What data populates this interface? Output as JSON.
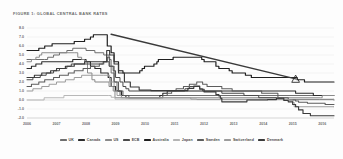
{
  "figure": {
    "title": "FIGURE 1: GLOBAL CENTRAL BANK RATES"
  },
  "chart_data": {
    "type": "line",
    "title": "FIGURE 1: GLOBAL CENTRAL BANK RATES",
    "xlabel": "",
    "ylabel": "",
    "xlim": [
      2006,
      2016.4
    ],
    "ylim": [
      -2.0,
      8.0
    ],
    "grid": true,
    "legend_position": "bottom",
    "x_ticks": [
      "2006",
      "2007",
      "2008",
      "2009",
      "2010",
      "2011",
      "2012",
      "2013",
      "2014",
      "2015",
      "2016"
    ],
    "y_ticks": [
      "8.0",
      "7.0",
      "6.0",
      "5.0",
      "4.0",
      "3.0",
      "2.0",
      "1.0",
      "0.0",
      "-1.0",
      "-2.0"
    ],
    "annotations": [
      {
        "name": "projection-marker",
        "shape": "triangle",
        "x": 2015.1,
        "y": 2.3
      }
    ],
    "series": [
      {
        "name": "UK",
        "color": "#6e6e6e",
        "width": 1.0,
        "points": [
          [
            2006.0,
            4.5
          ],
          [
            2006.6,
            4.5
          ],
          [
            2006.7,
            4.75
          ],
          [
            2006.9,
            5.0
          ],
          [
            2007.1,
            5.25
          ],
          [
            2007.35,
            5.5
          ],
          [
            2007.55,
            5.75
          ],
          [
            2007.9,
            5.75
          ],
          [
            2008.0,
            5.5
          ],
          [
            2008.3,
            5.25
          ],
          [
            2008.6,
            5.0
          ],
          [
            2008.78,
            4.5
          ],
          [
            2008.85,
            3.0
          ],
          [
            2008.95,
            2.0
          ],
          [
            2009.05,
            1.0
          ],
          [
            2009.15,
            0.5
          ],
          [
            2009.3,
            0.5
          ],
          [
            2016.4,
            0.5
          ]
        ]
      },
      {
        "name": "Canada",
        "color": "#2b2b2b",
        "width": 1.1,
        "points": [
          [
            2006.0,
            3.5
          ],
          [
            2006.15,
            3.75
          ],
          [
            2006.3,
            4.0
          ],
          [
            2006.5,
            4.25
          ],
          [
            2007.0,
            4.25
          ],
          [
            2007.55,
            4.5
          ],
          [
            2007.9,
            4.5
          ],
          [
            2008.0,
            4.25
          ],
          [
            2008.15,
            3.75
          ],
          [
            2008.3,
            3.5
          ],
          [
            2008.5,
            3.0
          ],
          [
            2008.75,
            2.5
          ],
          [
            2008.85,
            1.5
          ],
          [
            2009.0,
            1.0
          ],
          [
            2009.2,
            0.5
          ],
          [
            2009.35,
            0.25
          ],
          [
            2010.4,
            0.25
          ],
          [
            2010.5,
            0.5
          ],
          [
            2010.6,
            0.75
          ],
          [
            2010.75,
            1.0
          ],
          [
            2015.0,
            1.0
          ],
          [
            2015.1,
            0.75
          ],
          [
            2015.6,
            0.75
          ],
          [
            2015.7,
            0.5
          ],
          [
            2016.4,
            0.5
          ]
        ]
      },
      {
        "name": "US",
        "color": "#8a8a8a",
        "width": 1.0,
        "points": [
          [
            2006.0,
            4.25
          ],
          [
            2006.15,
            4.5
          ],
          [
            2006.3,
            4.75
          ],
          [
            2006.42,
            5.0
          ],
          [
            2006.5,
            5.25
          ],
          [
            2007.6,
            5.25
          ],
          [
            2007.72,
            4.75
          ],
          [
            2007.85,
            4.5
          ],
          [
            2007.95,
            4.25
          ],
          [
            2008.05,
            3.0
          ],
          [
            2008.2,
            2.25
          ],
          [
            2008.3,
            2.0
          ],
          [
            2008.78,
            1.5
          ],
          [
            2008.92,
            1.0
          ],
          [
            2008.98,
            0.25
          ],
          [
            2015.95,
            0.25
          ],
          [
            2016.0,
            0.5
          ],
          [
            2016.4,
            0.5
          ]
        ]
      },
      {
        "name": "ECB",
        "color": "#4a4a4a",
        "width": 1.0,
        "points": [
          [
            2006.0,
            2.25
          ],
          [
            2006.2,
            2.5
          ],
          [
            2006.45,
            2.75
          ],
          [
            2006.65,
            3.0
          ],
          [
            2006.9,
            3.25
          ],
          [
            2007.1,
            3.5
          ],
          [
            2007.35,
            3.75
          ],
          [
            2007.5,
            4.0
          ],
          [
            2008.5,
            4.0
          ],
          [
            2008.58,
            4.25
          ],
          [
            2008.78,
            3.75
          ],
          [
            2008.92,
            3.25
          ],
          [
            2009.0,
            2.5
          ],
          [
            2009.15,
            2.0
          ],
          [
            2009.25,
            1.5
          ],
          [
            2009.35,
            1.25
          ],
          [
            2009.45,
            1.0
          ],
          [
            2011.25,
            1.0
          ],
          [
            2011.35,
            1.25
          ],
          [
            2011.5,
            1.5
          ],
          [
            2011.85,
            1.25
          ],
          [
            2011.95,
            1.0
          ],
          [
            2012.6,
            0.75
          ],
          [
            2013.35,
            0.5
          ],
          [
            2013.85,
            0.25
          ],
          [
            2014.45,
            0.15
          ],
          [
            2014.65,
            0.05
          ],
          [
            2015.9,
            0.05
          ],
          [
            2016.4,
            0.0
          ]
        ]
      },
      {
        "name": "Australia",
        "color": "#1f1f1f",
        "width": 1.2,
        "points": [
          [
            2006.0,
            5.5
          ],
          [
            2006.4,
            5.75
          ],
          [
            2006.6,
            6.0
          ],
          [
            2006.85,
            6.25
          ],
          [
            2007.6,
            6.5
          ],
          [
            2007.95,
            6.75
          ],
          [
            2008.15,
            7.0
          ],
          [
            2008.25,
            7.25
          ],
          [
            2008.65,
            7.25
          ],
          [
            2008.72,
            6.0
          ],
          [
            2008.85,
            5.25
          ],
          [
            2008.95,
            4.25
          ],
          [
            2009.1,
            3.25
          ],
          [
            2009.25,
            3.0
          ],
          [
            2009.75,
            3.0
          ],
          [
            2009.82,
            3.25
          ],
          [
            2009.9,
            3.5
          ],
          [
            2009.98,
            3.75
          ],
          [
            2010.3,
            4.0
          ],
          [
            2010.4,
            4.25
          ],
          [
            2010.45,
            4.5
          ],
          [
            2010.95,
            4.75
          ],
          [
            2011.85,
            4.75
          ],
          [
            2011.92,
            4.5
          ],
          [
            2012.0,
            4.25
          ],
          [
            2012.4,
            3.75
          ],
          [
            2012.5,
            3.5
          ],
          [
            2012.85,
            3.25
          ],
          [
            2012.95,
            3.0
          ],
          [
            2013.4,
            2.75
          ],
          [
            2013.6,
            2.5
          ],
          [
            2015.15,
            2.25
          ],
          [
            2015.4,
            2.0
          ],
          [
            2016.4,
            2.0
          ]
        ]
      },
      {
        "name": "Japan",
        "color": "#b4b4b4",
        "width": 0.95,
        "points": [
          [
            2006.0,
            0.0
          ],
          [
            2006.5,
            0.0
          ],
          [
            2006.58,
            0.25
          ],
          [
            2007.15,
            0.25
          ],
          [
            2007.25,
            0.5
          ],
          [
            2008.75,
            0.5
          ],
          [
            2008.85,
            0.3
          ],
          [
            2008.98,
            0.1
          ],
          [
            2016.4,
            0.1
          ]
        ]
      },
      {
        "name": "Sweden",
        "color": "#5c5c5c",
        "width": 1.05,
        "points": [
          [
            2006.0,
            1.5
          ],
          [
            2006.15,
            1.75
          ],
          [
            2006.4,
            2.0
          ],
          [
            2006.6,
            2.25
          ],
          [
            2006.9,
            2.5
          ],
          [
            2007.1,
            2.75
          ],
          [
            2007.4,
            3.0
          ],
          [
            2007.6,
            3.25
          ],
          [
            2007.9,
            3.5
          ],
          [
            2008.15,
            3.75
          ],
          [
            2008.45,
            4.0
          ],
          [
            2008.6,
            4.25
          ],
          [
            2008.72,
            4.75
          ],
          [
            2008.8,
            3.75
          ],
          [
            2008.95,
            2.0
          ],
          [
            2009.1,
            1.0
          ],
          [
            2009.25,
            0.5
          ],
          [
            2009.45,
            0.25
          ],
          [
            2010.5,
            0.25
          ],
          [
            2010.6,
            0.5
          ],
          [
            2010.75,
            0.75
          ],
          [
            2010.9,
            1.0
          ],
          [
            2011.05,
            1.25
          ],
          [
            2011.3,
            1.5
          ],
          [
            2011.5,
            1.75
          ],
          [
            2011.75,
            2.0
          ],
          [
            2011.95,
            1.75
          ],
          [
            2012.1,
            1.5
          ],
          [
            2012.6,
            1.25
          ],
          [
            2012.95,
            1.0
          ],
          [
            2013.95,
            0.75
          ],
          [
            2014.5,
            0.25
          ],
          [
            2014.85,
            0.0
          ],
          [
            2015.1,
            -0.1
          ],
          [
            2015.2,
            -0.25
          ],
          [
            2015.5,
            -0.35
          ],
          [
            2016.1,
            -0.5
          ],
          [
            2016.4,
            -0.5
          ]
        ]
      },
      {
        "name": "Switzerland",
        "color": "#9c9c9c",
        "width": 1.0,
        "points": [
          [
            2006.0,
            1.0
          ],
          [
            2006.2,
            1.25
          ],
          [
            2006.5,
            1.5
          ],
          [
            2006.75,
            1.75
          ],
          [
            2007.0,
            2.0
          ],
          [
            2007.3,
            2.25
          ],
          [
            2007.6,
            2.5
          ],
          [
            2007.85,
            2.75
          ],
          [
            2008.6,
            2.75
          ],
          [
            2008.8,
            2.0
          ],
          [
            2008.95,
            1.0
          ],
          [
            2009.05,
            0.5
          ],
          [
            2009.2,
            0.25
          ],
          [
            2010.9,
            0.25
          ],
          [
            2011.3,
            0.25
          ],
          [
            2011.55,
            0.1
          ],
          [
            2011.75,
            0.05
          ],
          [
            2014.9,
            0.0
          ],
          [
            2015.0,
            -0.25
          ],
          [
            2015.05,
            -0.75
          ],
          [
            2015.12,
            -0.75
          ],
          [
            2016.4,
            -0.75
          ]
        ]
      },
      {
        "name": "Denmark",
        "color": "#3a3a3a",
        "width": 1.15,
        "points": [
          [
            2006.0,
            2.5
          ],
          [
            2006.25,
            2.75
          ],
          [
            2006.5,
            3.0
          ],
          [
            2006.8,
            3.25
          ],
          [
            2007.0,
            3.5
          ],
          [
            2007.3,
            3.75
          ],
          [
            2007.6,
            4.0
          ],
          [
            2007.95,
            4.25
          ],
          [
            2008.55,
            4.25
          ],
          [
            2008.7,
            5.5
          ],
          [
            2008.8,
            5.0
          ],
          [
            2008.95,
            4.0
          ],
          [
            2009.1,
            3.0
          ],
          [
            2009.3,
            2.0
          ],
          [
            2009.5,
            1.45
          ],
          [
            2009.8,
            1.1
          ],
          [
            2010.2,
            1.05
          ],
          [
            2011.3,
            1.05
          ],
          [
            2011.45,
            1.3
          ],
          [
            2011.65,
            1.55
          ],
          [
            2011.85,
            1.2
          ],
          [
            2012.0,
            0.9
          ],
          [
            2012.4,
            0.6
          ],
          [
            2012.5,
            0.45
          ],
          [
            2012.55,
            0.2
          ],
          [
            2012.6,
            -0.2
          ],
          [
            2013.3,
            -0.2
          ],
          [
            2013.45,
            0.0
          ],
          [
            2014.15,
            0.05
          ],
          [
            2014.45,
            0.2
          ],
          [
            2014.7,
            -0.05
          ],
          [
            2014.85,
            -0.2
          ],
          [
            2015.0,
            -0.5
          ],
          [
            2015.1,
            -0.75
          ],
          [
            2015.2,
            -1.1
          ],
          [
            2015.35,
            -1.5
          ],
          [
            2015.6,
            -1.75
          ],
          [
            2016.4,
            -1.75
          ]
        ]
      },
      {
        "name": "Projection",
        "color": "#3a3a3a",
        "width": 1.45,
        "points": [
          [
            2008.85,
            7.3
          ],
          [
            2015.1,
            2.35
          ]
        ]
      }
    ]
  },
  "legend": {
    "items": [
      {
        "label": "UK",
        "color": "#6e6e6e"
      },
      {
        "label": "Canada",
        "color": "#2b2b2b"
      },
      {
        "label": "US",
        "color": "#8a8a8a"
      },
      {
        "label": "ECB",
        "color": "#4a4a4a"
      },
      {
        "label": "Australia",
        "color": "#1f1f1f"
      },
      {
        "label": "Japan",
        "color": "#b4b4b4"
      },
      {
        "label": "Sweden",
        "color": "#5c5c5c"
      },
      {
        "label": "Switzerland",
        "color": "#9c9c9c"
      },
      {
        "label": "Denmark",
        "color": "#3a3a3a"
      }
    ]
  }
}
